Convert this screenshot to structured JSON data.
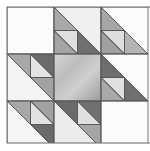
{
  "image": {
    "title": "Quilt block pattern",
    "description": "Hovering hawks style quilt block with half-square triangles around a gradient gray center square"
  },
  "colors": {
    "background": "#ffffff",
    "white_patch": "#fbfbfb",
    "light": "#e2e2e2",
    "medium": "#a9a9a9",
    "dark": "#6e6e6e",
    "center_light": "#d8d8d8",
    "center_dark": "#9a9a9a",
    "seam": "#555555"
  },
  "grid": {
    "origin_x": 7,
    "origin_y": 7,
    "unit": 23.5,
    "cols": 6,
    "rows": 6
  }
}
